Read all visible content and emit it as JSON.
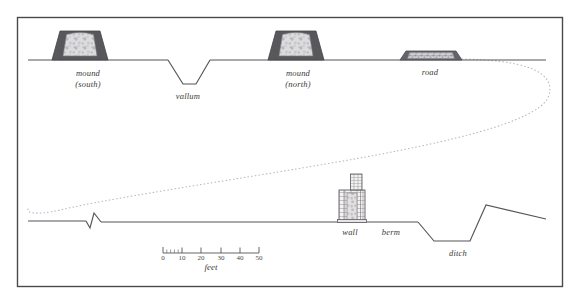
{
  "figure": {
    "frame": {
      "x": 17,
      "y": 17,
      "width": 546,
      "height": 270,
      "border_color": "#4a4a4a"
    },
    "background_color": "#ffffff",
    "line_color": "#55555a",
    "dotted_color": "#b9b4c4"
  },
  "upper_profile": {
    "ground_y": 60,
    "features": [
      {
        "name": "mound-south",
        "label_lines": [
          "mound",
          "(south)"
        ],
        "label_x": 88,
        "label_y": 68,
        "shape": "trapezoid-mound",
        "base_left": 52,
        "base_right": 108,
        "top_left": 60,
        "top_right": 100,
        "top_y": 31,
        "fill": "#57575c",
        "inner_fill": "#d9d9dc"
      },
      {
        "name": "vallum",
        "label_lines": [
          "vallum"
        ],
        "label_x": 188,
        "label_y": 92,
        "shape": "v-ditch",
        "left_edge": 168,
        "bottom_left": 183,
        "bottom_right": 196,
        "right_edge": 210,
        "depth_y": 84
      },
      {
        "name": "mound-north",
        "label_lines": [
          "mound",
          "(north)"
        ],
        "label_x": 298,
        "label_y": 68,
        "shape": "trapezoid-mound",
        "base_left": 268,
        "base_right": 324,
        "top_left": 276,
        "top_right": 316,
        "top_y": 31,
        "fill": "#57575c",
        "inner_fill": "#d9d9dc"
      },
      {
        "name": "road",
        "label_lines": [
          "road"
        ],
        "label_x": 430,
        "label_y": 68,
        "shape": "flat-road",
        "base_left": 400,
        "base_right": 462,
        "top_left": 407,
        "top_right": 455,
        "top_y": 51,
        "fill": "#636368",
        "inner_fill": "#c9c9cc"
      }
    ]
  },
  "lower_profile": {
    "ground_y": 221,
    "features": [
      {
        "name": "small-notch",
        "label_lines": [],
        "apex_x": 93,
        "notch_left": 86,
        "notch_right": 101,
        "peak_y": 213,
        "dip_y": 228
      },
      {
        "name": "wall",
        "label_lines": [
          "wall"
        ],
        "label_x": 350,
        "label_y": 228,
        "shape": "masonry-wall",
        "base_left": 339,
        "base_right": 365,
        "base_top_y": 190,
        "tower_left": 351,
        "tower_right": 362,
        "tower_top_y": 174,
        "fill": "#f2f0ef",
        "stroke": "#6a6a70"
      },
      {
        "name": "berm",
        "label_lines": [
          "berm"
        ],
        "label_x": 391,
        "label_y": 228,
        "shape": "flat-terrace",
        "start_x": 366,
        "end_x": 418
      },
      {
        "name": "ditch",
        "label_lines": [
          "ditch"
        ],
        "label_x": 458,
        "label_y": 249,
        "shape": "trapezoid-ditch",
        "left_edge": 418,
        "bottom_left": 434,
        "bottom_right": 470,
        "right_edge": 486,
        "depth_y": 241
      },
      {
        "name": "counterscarp-rise",
        "label_lines": [],
        "crest_x": 486,
        "crest_y": 205,
        "end_x": 546,
        "end_y": 219
      }
    ]
  },
  "connector": {
    "name": "dotted-correlation-curve",
    "style": "dotted",
    "color": "#b9b4c4",
    "description": "sweeping dotted curve linking upper road level to lower ground level"
  },
  "scale_bar": {
    "caption": "feet",
    "caption_x": 211,
    "caption_y": 263,
    "axis_y": 253,
    "start_x": 163,
    "end_x": 259,
    "ticks": [
      {
        "label": "0",
        "x": 163
      },
      {
        "label": "10",
        "x": 182
      },
      {
        "label": "20",
        "x": 201
      },
      {
        "label": "30",
        "x": 221
      },
      {
        "label": "40",
        "x": 240
      },
      {
        "label": "50",
        "x": 259
      }
    ],
    "subdivision_count": 5,
    "units": "feet"
  }
}
